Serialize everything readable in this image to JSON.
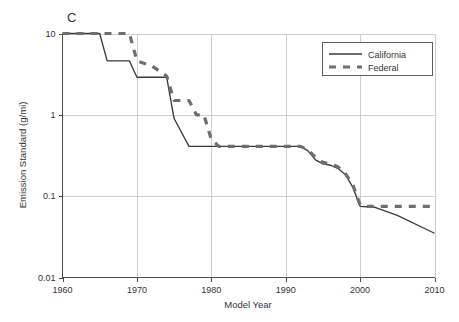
{
  "figure": {
    "panel_label": "C",
    "background_color": "#ffffff"
  },
  "chart_data": {
    "type": "line",
    "title": "C",
    "xlabel": "Model Year",
    "ylabel": "Emission Standard (g/mi)",
    "xlim": [
      1960,
      2010
    ],
    "ylim": [
      0.01,
      10
    ],
    "yscale": "log",
    "xscale": "linear",
    "grid": true,
    "grid_axes": "both",
    "legend_position": "top-right",
    "xticks": [
      1960,
      1970,
      1980,
      1990,
      2000,
      2010
    ],
    "xtick_labels": [
      "1960",
      "1970",
      "1980",
      "1990",
      "2000",
      "2010"
    ],
    "yticks": [
      0.01,
      0.1,
      1,
      10
    ],
    "ytick_labels": [
      "0.01",
      "0.1",
      "1",
      "10"
    ],
    "series": [
      {
        "name": "California",
        "style": "solid",
        "color": "#3b3b3b",
        "points": [
          [
            1960,
            10.0
          ],
          [
            1965,
            10.0
          ],
          [
            1966,
            4.6
          ],
          [
            1969,
            4.6
          ],
          [
            1970,
            2.9
          ],
          [
            1974,
            2.9
          ],
          [
            1975,
            0.9
          ],
          [
            1977,
            0.41
          ],
          [
            1992,
            0.41
          ],
          [
            1993,
            0.36
          ],
          [
            1994,
            0.28
          ],
          [
            1995,
            0.25
          ],
          [
            1996,
            0.24
          ],
          [
            1997,
            0.22
          ],
          [
            1998,
            0.185
          ],
          [
            1999,
            0.13
          ],
          [
            2000,
            0.075
          ],
          [
            2002,
            0.073
          ],
          [
            2005,
            0.058
          ],
          [
            2010,
            0.035
          ]
        ]
      },
      {
        "name": "Federal",
        "style": "dashed",
        "color": "#6e6e6e",
        "points": [
          [
            1960,
            10.0
          ],
          [
            1969,
            10.0
          ],
          [
            1970,
            4.6
          ],
          [
            1972,
            4.0
          ],
          [
            1974,
            3.0
          ],
          [
            1975,
            1.5
          ],
          [
            1977,
            1.5
          ],
          [
            1978,
            1.0
          ],
          [
            1979,
            1.0
          ],
          [
            1980,
            0.5
          ],
          [
            1981,
            0.41
          ],
          [
            1992,
            0.41
          ],
          [
            1993,
            0.37
          ],
          [
            1994,
            0.3
          ],
          [
            1995,
            0.26
          ],
          [
            1996,
            0.25
          ],
          [
            1997,
            0.23
          ],
          [
            1998,
            0.19
          ],
          [
            1999,
            0.14
          ],
          [
            2000,
            0.078
          ],
          [
            2001,
            0.075
          ],
          [
            2010,
            0.075
          ]
        ]
      }
    ]
  },
  "legend": {
    "entries": [
      {
        "label": "California",
        "style": "solid"
      },
      {
        "label": "Federal",
        "style": "dashed"
      }
    ]
  },
  "axes": {
    "x_title": "Model Year",
    "y_title": "Emission Standard (g/mi)",
    "x_tick_labels": [
      "1960",
      "1970",
      "1980",
      "1990",
      "2000",
      "2010"
    ],
    "y_tick_labels": [
      "10",
      "1",
      "0.1",
      "0.01"
    ]
  }
}
